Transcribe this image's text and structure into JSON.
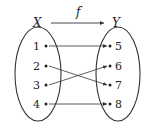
{
  "diagram": {
    "function_label": "f",
    "domain_set": {
      "name": "X",
      "elements": [
        "1",
        "2",
        "3",
        "4"
      ]
    },
    "codomain_set": {
      "name": "Y",
      "elements": [
        "5",
        "6",
        "7",
        "8"
      ]
    },
    "mappings": [
      {
        "from": "1",
        "to": "5"
      },
      {
        "from": "2",
        "to": "7"
      },
      {
        "from": "3",
        "to": "6"
      },
      {
        "from": "4",
        "to": "8"
      }
    ],
    "colors": {
      "stroke": "#333333",
      "background": "#ffffff"
    }
  }
}
